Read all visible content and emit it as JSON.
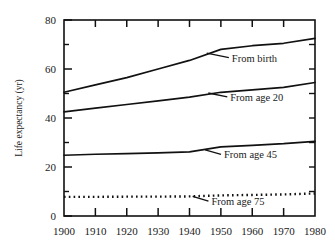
{
  "chart_data": {
    "type": "line",
    "title": "",
    "xlabel": "",
    "ylabel": "Life expectancy (yr)",
    "xlim": [
      1900,
      1980
    ],
    "ylim": [
      0,
      80
    ],
    "grid": false,
    "legend_position": "inline-annotations",
    "x_ticks": [
      "1900",
      "1910",
      "1920",
      "1930",
      "1940",
      "1950",
      "1960",
      "1970",
      "1980"
    ],
    "x_tick_values": [
      1900,
      1910,
      1920,
      1930,
      1940,
      1950,
      1960,
      1970,
      1980
    ],
    "y_ticks": [
      "0",
      "20",
      "40",
      "60",
      "80"
    ],
    "y_tick_values": [
      0,
      20,
      40,
      60,
      80
    ],
    "y_minor_tick_values": [
      10,
      30,
      50,
      70
    ],
    "x": [
      1900,
      1910,
      1920,
      1930,
      1940,
      1950,
      1960,
      1970,
      1980
    ],
    "series": [
      {
        "name": "From birth",
        "style": "solid",
        "values": [
          50.5,
          53.5,
          56.5,
          60.0,
          63.5,
          68.0,
          69.5,
          70.5,
          72.5
        ]
      },
      {
        "name": "From age 20",
        "style": "solid",
        "values": [
          42.5,
          44.0,
          45.5,
          47.0,
          48.5,
          50.5,
          51.5,
          52.5,
          54.5
        ]
      },
      {
        "name": "From age 45",
        "style": "solid",
        "values": [
          24.8,
          25.2,
          25.5,
          25.8,
          26.2,
          28.2,
          28.8,
          29.5,
          30.5
        ]
      },
      {
        "name": "From age 75",
        "style": "dotted",
        "values": [
          7.8,
          7.8,
          7.9,
          7.9,
          8.0,
          8.4,
          8.6,
          8.8,
          9.2
        ]
      }
    ],
    "annotations": [
      {
        "text": "From birth",
        "series": "From birth",
        "label_year": 1953.5,
        "label_value": 63.0,
        "leader_year": 1945.5,
        "leader_value": 66.5
      },
      {
        "text": "From age 20",
        "series": "From age 20",
        "label_year": 1953.0,
        "label_value": 47.0,
        "leader_year": 1946.0,
        "leader_value": 50.2
      },
      {
        "text": "From age 45",
        "series": "From age 45",
        "label_year": 1951.0,
        "label_value": 23.5,
        "leader_year": 1945.0,
        "leader_value": 27.0
      },
      {
        "text": "From age 75",
        "series": "From age 75",
        "label_year": 1947.0,
        "label_value": 4.4,
        "leader_year": 1941.0,
        "leader_value": 8.0
      }
    ]
  }
}
